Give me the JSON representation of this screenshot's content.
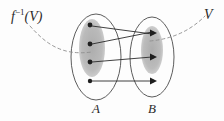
{
  "figure": {
    "type": "set-mapping-diagram",
    "background_color": "#fdfdfd",
    "ink_color": "#2b2b2b",
    "shade_color": "#b8b8b8",
    "labels": {
      "domain_set": "A",
      "codomain_set": "B",
      "preimage_f": "f",
      "preimage_exponent": "−1",
      "preimage_arg": "(V)",
      "target_set": "V"
    },
    "outer_ellipses": [
      {
        "name": "A",
        "cx": 96,
        "cy": 57,
        "rx": 25,
        "ry": 43
      },
      {
        "name": "B",
        "cx": 152,
        "cy": 57,
        "rx": 22,
        "ry": 40
      }
    ],
    "inner_shaded_ellipses": [
      {
        "name": "preimage-region",
        "cx": 92,
        "cy": 48,
        "rx": 13,
        "ry": 29
      },
      {
        "name": "target-region",
        "cx": 152,
        "cy": 50,
        "rx": 11,
        "ry": 24
      }
    ],
    "points_A": [
      {
        "id": "a1",
        "x": 90,
        "y": 25
      },
      {
        "id": "a2",
        "x": 90,
        "y": 44
      },
      {
        "id": "a3",
        "x": 90,
        "y": 62
      },
      {
        "id": "a4",
        "x": 90,
        "y": 81
      }
    ],
    "points_B": [
      {
        "id": "b1",
        "x": 156,
        "y": 33
      },
      {
        "id": "b2",
        "x": 156,
        "y": 57
      },
      {
        "id": "b3",
        "x": 156,
        "y": 81
      }
    ],
    "arrows": [
      {
        "id": "a1-b1",
        "from": "a1",
        "to": "b1",
        "x1": 92,
        "y1": 26,
        "x2": 154,
        "y2": 34
      },
      {
        "id": "a2-b1",
        "from": "a2",
        "to": "b1",
        "x1": 92,
        "y1": 44,
        "x2": 154,
        "y2": 32
      },
      {
        "id": "a3-b2",
        "from": "a3",
        "to": "b2",
        "x1": 92,
        "y1": 62,
        "x2": 154,
        "y2": 57
      },
      {
        "id": "a4-b3",
        "from": "a4",
        "to": "b3",
        "x1": 92,
        "y1": 81,
        "x2": 154,
        "y2": 81
      }
    ],
    "dashed_curve": {
      "name": "preimage-annotation-curve",
      "left_path": "M 30 26 C 46 44, 62 56, 92 52",
      "right_path": "M 152 40 C 176 38, 192 30, 206 16",
      "style": "dashed"
    },
    "label_positions": {
      "preimage": {
        "x": 11,
        "y": 10
      },
      "target": {
        "x": 205,
        "y": 10
      },
      "set_a": {
        "x": 92,
        "y": 103
      },
      "set_b": {
        "x": 148,
        "y": 103
      }
    }
  }
}
